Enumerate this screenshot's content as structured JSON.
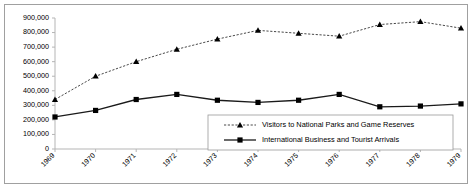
{
  "chart_data": {
    "type": "line",
    "title": "",
    "xlabel": "",
    "ylabel": "",
    "categories": [
      "1969",
      "1970",
      "1971",
      "1972",
      "1973",
      "1974",
      "1975",
      "1976",
      "1977",
      "1978",
      "1979"
    ],
    "ylim": [
      0,
      900000
    ],
    "ytick_values": [
      0,
      100000,
      200000,
      300000,
      400000,
      500000,
      600000,
      700000,
      800000,
      900000
    ],
    "ytick_labels": [
      "0",
      "100,000",
      "200,000",
      "300,000",
      "400,000",
      "500,000",
      "600,000",
      "700,000",
      "800,000",
      "900,000"
    ],
    "grid": false,
    "legend_position": "inside-bottom-right",
    "series": [
      {
        "name": "Visitors to National Parks and Game Reserves",
        "marker": "triangle",
        "line_style": "dashed",
        "color": "#333333",
        "values": [
          340000,
          500000,
          600000,
          685000,
          755000,
          815000,
          795000,
          775000,
          855000,
          875000,
          830000
        ]
      },
      {
        "name": "International Business and Tourist Arrivals",
        "marker": "square",
        "line_style": "solid",
        "color": "#1a1a1a",
        "values": [
          220000,
          265000,
          340000,
          375000,
          335000,
          320000,
          335000,
          375000,
          290000,
          295000,
          310000
        ]
      }
    ]
  },
  "legend": {
    "entries": [
      "Visitors to National Parks and Game Reserves",
      "International Business and Tourist Arrivals"
    ]
  }
}
